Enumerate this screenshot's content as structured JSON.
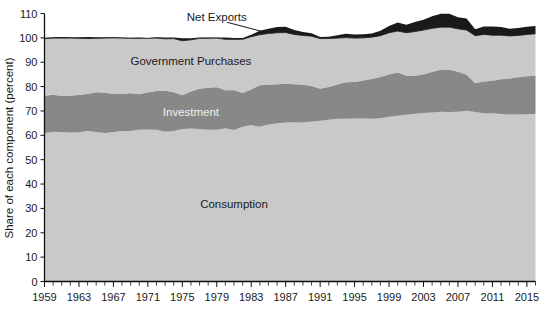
{
  "chart_data": {
    "type": "area",
    "title": "",
    "subtitle": "",
    "xlabel": "",
    "ylabel": "Share of each component (percent)",
    "ylim": [
      0,
      110
    ],
    "xlim": [
      1959,
      2016
    ],
    "grid": false,
    "legend_position": "in-plot-labels",
    "stacked": true,
    "y_ticks": [
      0,
      10,
      20,
      30,
      40,
      50,
      60,
      70,
      80,
      90,
      100,
      110
    ],
    "y_tick_labels": [
      "0",
      "10",
      "20",
      "30",
      "40",
      "50",
      "60",
      "70",
      "80",
      "90",
      "100",
      "110"
    ],
    "x_ticks": [
      1959,
      1963,
      1967,
      1971,
      1975,
      1979,
      1983,
      1987,
      1991,
      1995,
      1999,
      2003,
      2007,
      2011,
      2015
    ],
    "x_tick_labels": [
      "1959",
      "1963",
      "1967",
      "1971",
      "1975",
      "1979",
      "1983",
      "1987",
      "1991",
      "1995",
      "1999",
      "2003",
      "2007",
      "2011",
      "2015"
    ],
    "x_minor_tick_interval": 1,
    "colors": {
      "consumption": "#c9c9c9",
      "investment": "#888888",
      "government": "#c9c9c9",
      "net_exports": "#1a1a1a",
      "plot_background": "#ffffff",
      "axis": "#111111",
      "text": "#1a1a1a",
      "investment_label_text": "#f0f0f0"
    },
    "x": [
      1959,
      1960,
      1961,
      1962,
      1963,
      1964,
      1965,
      1966,
      1967,
      1968,
      1969,
      1970,
      1971,
      1972,
      1973,
      1974,
      1975,
      1976,
      1977,
      1978,
      1979,
      1980,
      1981,
      1982,
      1983,
      1984,
      1985,
      1986,
      1987,
      1988,
      1989,
      1990,
      1991,
      1992,
      1993,
      1994,
      1995,
      1996,
      1997,
      1998,
      1999,
      2000,
      2001,
      2002,
      2003,
      2004,
      2005,
      2006,
      2007,
      2008,
      2009,
      2010,
      2011,
      2012,
      2013,
      2014,
      2015,
      2016
    ],
    "series": [
      {
        "name": "Consumption",
        "label": "Consumption",
        "color": "#c9c9c9",
        "label_x": 1981,
        "label_y": 30,
        "values": [
          61.0,
          61.5,
          61.4,
          61.2,
          61.3,
          61.8,
          61.4,
          61.0,
          61.4,
          61.8,
          61.8,
          62.3,
          62.4,
          62.3,
          61.5,
          61.8,
          62.6,
          62.8,
          62.6,
          62.3,
          62.3,
          62.9,
          62.2,
          63.5,
          64.2,
          63.5,
          64.4,
          65.0,
          65.3,
          65.4,
          65.3,
          65.7,
          66.0,
          66.4,
          66.8,
          66.8,
          66.9,
          66.9,
          66.8,
          67.0,
          67.6,
          68.0,
          68.4,
          68.9,
          69.2,
          69.4,
          69.7,
          69.6,
          69.7,
          70.1,
          69.6,
          69.1,
          69.1,
          68.8,
          68.5,
          68.5,
          68.6,
          68.8
        ]
      },
      {
        "name": "Investment",
        "label": "Investment",
        "color": "#888888",
        "label_x": 1976,
        "label_y": 68,
        "values": [
          15.2,
          15.1,
          14.7,
          15.0,
          15.2,
          15.2,
          16.3,
          16.5,
          15.6,
          15.3,
          15.5,
          14.6,
          15.2,
          15.9,
          16.8,
          15.9,
          13.8,
          15.2,
          16.5,
          17.2,
          17.4,
          15.6,
          16.3,
          13.9,
          14.6,
          17.1,
          16.4,
          16.0,
          15.9,
          15.6,
          15.5,
          14.5,
          13.1,
          13.4,
          14.1,
          15.0,
          15.0,
          15.6,
          16.3,
          16.9,
          17.4,
          17.8,
          16.1,
          15.6,
          15.8,
          16.6,
          17.2,
          17.3,
          16.4,
          14.8,
          11.8,
          13.0,
          13.3,
          14.2,
          14.8,
          15.3,
          15.6,
          15.6
        ]
      },
      {
        "name": "Government Purchases",
        "label": "Government Purchases",
        "color": "#c9c9c9",
        "label_x": 1976,
        "label_y": 89,
        "values": [
          23.5,
          23.3,
          23.8,
          23.7,
          23.3,
          22.7,
          22.1,
          22.4,
          23.0,
          22.8,
          22.5,
          22.9,
          22.2,
          21.7,
          21.3,
          22.0,
          22.4,
          21.2,
          20.7,
          20.3,
          20.2,
          20.9,
          20.9,
          22.0,
          21.7,
          20.7,
          21.0,
          21.1,
          21.0,
          20.4,
          20.2,
          20.5,
          20.6,
          19.9,
          19.0,
          18.3,
          18.0,
          17.5,
          17.2,
          17.0,
          17.1,
          17.0,
          17.6,
          18.1,
          18.2,
          17.9,
          17.5,
          17.5,
          17.6,
          18.3,
          19.5,
          19.3,
          18.7,
          18.1,
          17.5,
          17.2,
          17.2,
          17.3
        ]
      },
      {
        "name": "Net Exports",
        "label": "Net Exports",
        "color": "#1a1a1a",
        "label_x": 1979,
        "label_y": 107,
        "values": [
          0.3,
          0.4,
          0.5,
          0.4,
          0.5,
          0.7,
          0.5,
          0.4,
          0.4,
          0.2,
          0.2,
          0.3,
          0.1,
          0.4,
          0.6,
          0.5,
          1.0,
          0.6,
          0.4,
          0.3,
          0.2,
          0.8,
          0.5,
          0.5,
          0.8,
          1.6,
          1.9,
          2.4,
          2.4,
          1.8,
          1.4,
          1.2,
          0.7,
          0.8,
          1.2,
          1.6,
          1.5,
          1.5,
          1.5,
          2.0,
          2.8,
          3.5,
          3.3,
          3.9,
          4.2,
          5.0,
          5.5,
          5.5,
          4.8,
          4.7,
          2.6,
          3.3,
          3.6,
          3.4,
          2.9,
          3.0,
          3.2,
          3.2
        ]
      }
    ],
    "annotations": [
      {
        "name": "net-exports-leader-line",
        "from": [
          1980.2,
          106.4
        ],
        "to": [
          1984.5,
          102.4
        ]
      }
    ]
  }
}
